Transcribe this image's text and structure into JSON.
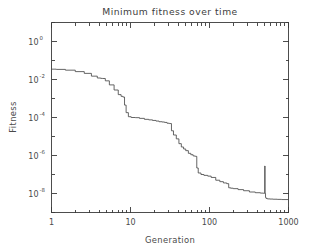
{
  "chart_data": {
    "type": "line",
    "title": "Minimum fitness over time",
    "xlabel": "Generation",
    "ylabel": "Fitness",
    "xscale": "log",
    "yscale": "log",
    "xlim": [
      1,
      1000
    ],
    "ylim": [
      1e-09,
      10
    ],
    "grid": false,
    "legend": null,
    "xticks": [
      1,
      10,
      100,
      1000
    ],
    "xtick_labels": [
      "1",
      "10",
      "100",
      "1000"
    ],
    "yticks": [
      1,
      0.01,
      0.0001,
      1e-06,
      1e-08
    ],
    "ytick_labels": [
      "10^0",
      "10^-2",
      "10^-4",
      "10^-6",
      "10^-8"
    ],
    "ytick_mantissa": [
      "10",
      "10",
      "10",
      "10",
      "10"
    ],
    "ytick_exponents": [
      "0",
      "-2",
      "-4",
      "-6",
      "-8"
    ],
    "line_color": "#4a4a4a",
    "series": [
      {
        "name": "minimum fitness",
        "x": [
          1,
          1.15,
          1.5,
          2.0,
          2.6,
          3.2,
          3.8,
          4.2,
          4.4,
          4.8,
          5.4,
          6.2,
          7.0,
          7.6,
          8.0,
          8.4,
          8.8,
          9.4,
          10.2,
          11.5,
          13.0,
          15.0,
          17.0,
          19.0,
          21.0,
          23.0,
          25.0,
          27.0,
          29.0,
          31.0,
          33.0,
          35.0,
          38.0,
          41.0,
          44.0,
          47.0,
          50.0,
          54.0,
          58.0,
          62.0,
          65.0,
          67.0,
          69.0,
          72.0,
          78.0,
          85.0,
          95.0,
          105.0,
          120.0,
          135.0,
          150.0,
          165.0,
          175.0,
          185.0,
          200.0,
          230.0,
          270.0,
          320.0,
          380.0,
          440.0,
          480.0,
          495.0,
          500.0,
          505.0,
          512.0,
          520.0,
          540.0,
          580.0,
          640.0,
          720.0,
          820.0,
          1000.0
        ],
        "y": [
          0.035,
          0.034,
          0.031,
          0.026,
          0.021,
          0.015,
          0.012,
          0.0115,
          0.0113,
          0.0085,
          0.0052,
          0.0028,
          0.0016,
          0.0013,
          0.0012,
          0.00045,
          0.00018,
          0.00011,
          0.0001,
          9.8e-05,
          9e-05,
          8e-05,
          7.5e-05,
          7e-05,
          6.5e-05,
          6e-05,
          5.8e-05,
          5.5e-05,
          5e-05,
          4.8e-05,
          2e-05,
          1.2e-05,
          7.5e-06,
          4.2e-06,
          2.8e-06,
          2.2e-06,
          1.8e-06,
          1.3e-06,
          1.1e-06,
          9.5e-07,
          9.2e-07,
          9e-07,
          2.2e-07,
          1.2e-07,
          1e-07,
          9e-08,
          8.2e-08,
          7e-08,
          5e-08,
          4.2e-08,
          3.6e-08,
          3.3e-08,
          2e-08,
          1.9e-08,
          1.8e-08,
          1.6e-08,
          1.4e-08,
          1.2e-08,
          1.1e-08,
          1.05e-08,
          1.03e-08,
          1.02e-08,
          2.8e-07,
          1.02e-08,
          6.2e-09,
          5.5e-09,
          5.2e-09,
          5.1e-09,
          5e-09,
          4.9e-09,
          4.8e-09,
          4.8e-09
        ],
        "annotations": [
          {
            "label": "spike",
            "x": 500,
            "y": 2.8e-07
          }
        ]
      }
    ]
  }
}
